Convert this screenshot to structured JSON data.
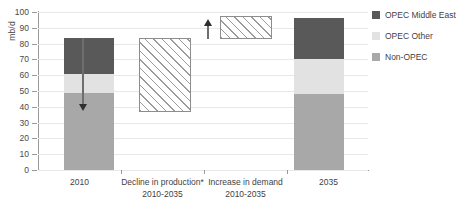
{
  "chart_data": {
    "type": "bar",
    "title": "",
    "xlabel": "",
    "ylabel": "mb/d",
    "ylim": [
      0,
      100
    ],
    "ytick_step": 10,
    "ytick_labels": [
      "100",
      "90",
      "80",
      "70",
      "60",
      "50",
      "40",
      "30",
      "20",
      "10",
      "0"
    ],
    "grid": true,
    "legend_position": "right",
    "categories": [
      "2010",
      "Decline in production*\n2010-2035",
      "Increase in demand\n2010-2035",
      "2035"
    ],
    "series": [
      {
        "name": "Non-OPEC",
        "color": "#a8a8a8",
        "values": [
          49,
          null,
          null,
          48
        ]
      },
      {
        "name": "OPEC Other",
        "color": "#e2e2e2",
        "values": [
          12,
          null,
          null,
          22
        ]
      },
      {
        "name": "OPEC Middle East",
        "color": "#595959",
        "values": [
          22.5,
          null,
          null,
          26
        ]
      }
    ],
    "totals": [
      83.5,
      null,
      null,
      96
    ],
    "floating_bars": [
      {
        "category": "Decline in production*\n2010-2035",
        "bottom": 37,
        "top": 82,
        "magnitude": 45,
        "style": "hatched",
        "arrow": "down"
      },
      {
        "category": "Increase in demand\n2010-2035",
        "bottom": 83,
        "top": 96,
        "magnitude": 13,
        "style": "hatched",
        "arrow": "up"
      }
    ],
    "annotations": [
      {
        "name": "decline-arrow",
        "direction": "down",
        "from": 83,
        "to": 39
      },
      {
        "name": "demand-arrow",
        "direction": "up",
        "from": 83,
        "to": 96
      }
    ]
  },
  "axis": {
    "y_title": "mb/d"
  },
  "categories": [
    {
      "line1": "2010",
      "line2": ""
    },
    {
      "line1": "Decline in production*",
      "line2": "2010-2035"
    },
    {
      "line1": "Increase in demand",
      "line2": "2010-2035"
    },
    {
      "line1": "2035",
      "line2": ""
    }
  ],
  "legend": {
    "items": [
      {
        "label": "OPEC Middle East",
        "color": "#595959"
      },
      {
        "label": "OPEC Other",
        "color": "#e2e2e2"
      },
      {
        "label": "Non-OPEC",
        "color": "#a8a8a8"
      }
    ]
  }
}
